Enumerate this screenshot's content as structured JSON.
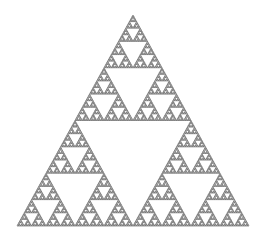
{
  "figure": {
    "type": "sierpinski-triangle",
    "apex": [
      133,
      15
    ],
    "base_left": [
      17,
      226
    ],
    "base_right": [
      249,
      226
    ],
    "depth": 7,
    "stroke_color": "#555555",
    "fill_color": "#ffffff",
    "background": "#ffffff"
  }
}
